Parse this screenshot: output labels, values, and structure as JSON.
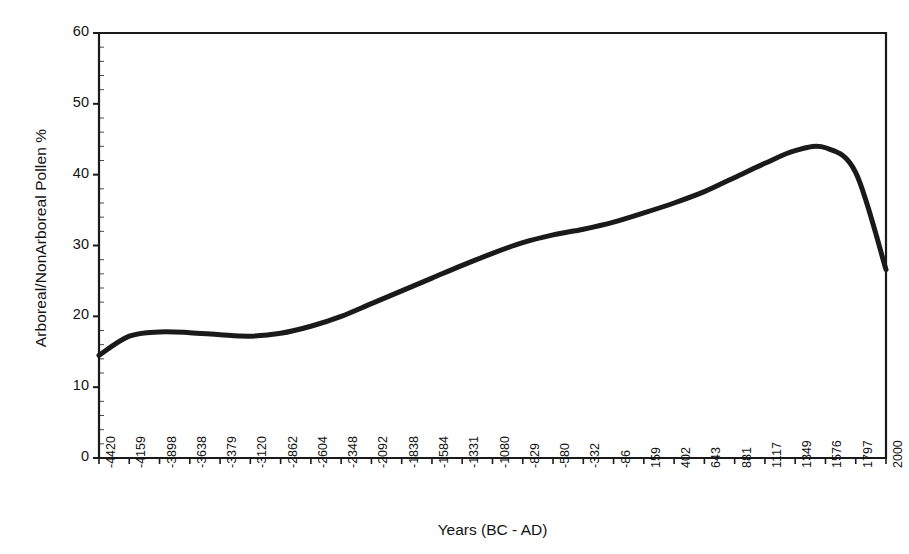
{
  "chart_data": {
    "type": "line",
    "title": "",
    "xlabel": "Years (BC - AD)",
    "ylabel": "Arboreal/NonArboreal Pollen %",
    "ylim": [
      0,
      60
    ],
    "yticks": [
      0,
      10,
      20,
      30,
      40,
      50,
      60
    ],
    "grid": false,
    "legend": null,
    "categories": [
      "-4420",
      "-4159",
      "-3898",
      "-3638",
      "-3379",
      "-3120",
      "-2862",
      "-2604",
      "-2348",
      "-2092",
      "-1838",
      "-1584",
      "-1331",
      "-1080",
      "-829",
      "-580",
      "-332",
      "-86",
      "159",
      "402",
      "643",
      "881",
      "1117",
      "1349",
      "1576",
      "1797",
      "2000"
    ],
    "values": [
      14.5,
      17.2,
      17.8,
      17.7,
      17.4,
      17.2,
      17.6,
      18.6,
      20.0,
      21.8,
      23.6,
      25.4,
      27.2,
      28.9,
      30.4,
      31.5,
      32.3,
      33.3,
      34.6,
      36.0,
      37.6,
      39.6,
      41.6,
      43.4,
      43.8,
      40.3,
      26.6
    ],
    "series": [
      {
        "name": "Arboreal/NonArboreal Pollen %",
        "color": "#1a1a1a",
        "linewidth": 5,
        "values": [
          14.5,
          17.2,
          17.8,
          17.7,
          17.4,
          17.2,
          17.6,
          18.6,
          20.0,
          21.8,
          23.6,
          25.4,
          27.2,
          28.9,
          30.4,
          31.5,
          32.3,
          33.3,
          34.6,
          36.0,
          37.6,
          39.6,
          41.6,
          43.4,
          43.8,
          40.3,
          26.6
        ]
      }
    ]
  },
  "axes": {
    "frame_color": "#1a1a1a",
    "background": "#ffffff",
    "tick_color": "#1a1a1a",
    "y_axis_min_label": "0",
    "y_axis_max_label": "60"
  }
}
